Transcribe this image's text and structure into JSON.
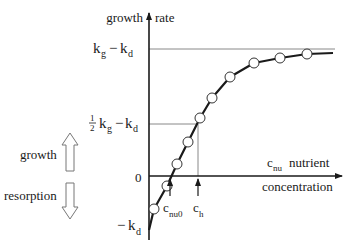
{
  "diagram": {
    "y_axis": {
      "label_left": "growth",
      "label_right": "rate",
      "ticks": {
        "top": {
          "main": "k",
          "sub1": "g",
          "minus": "−",
          "main2": "k",
          "sub2": "d"
        },
        "half": {
          "num": "1",
          "den": "2",
          "main": "k",
          "sub1": "g",
          "minus": "−",
          "main2": "k",
          "sub2": "d"
        },
        "zero": "0",
        "bottom": {
          "minus": "−",
          "main": "k",
          "sub": "d"
        }
      }
    },
    "x_axis": {
      "var_main": "c",
      "var_sub": "nu",
      "label_line1": "nutrient",
      "label_line2": "concentration",
      "markers": [
        {
          "main": "c",
          "sub": "nu0"
        },
        {
          "main": "c",
          "sub": "h"
        }
      ]
    },
    "legend": {
      "growth": "growth",
      "resorption": "resorption"
    },
    "curve_points": [
      [
        154,
        209
      ],
      [
        167,
        186
      ],
      [
        177,
        164
      ],
      [
        188,
        142
      ],
      [
        200,
        118
      ],
      [
        212,
        98
      ],
      [
        230,
        77
      ],
      [
        254,
        63
      ],
      [
        280,
        58
      ],
      [
        307,
        54
      ]
    ],
    "curve_end": [
      333,
      53
    ]
  }
}
